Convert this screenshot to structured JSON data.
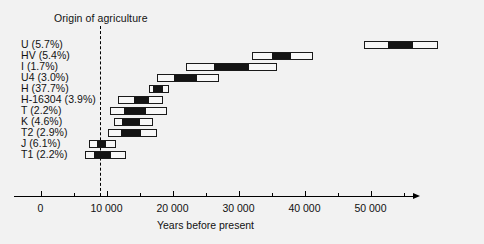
{
  "figure": {
    "background": "#f2f2f2",
    "bar_fill": "#f7f7f7",
    "bar_core": "#141414",
    "bar_edge": "#1a1a1a"
  },
  "annotation": {
    "origin_label": "Origin of agriculture",
    "origin_value": 9000
  },
  "chart_data": {
    "type": "bar",
    "orientation": "horizontal",
    "title": "",
    "xlabel": "Years before present",
    "ylabel": "",
    "xlim": [
      -3000,
      57000
    ],
    "xticks": [
      0,
      10000,
      20000,
      30000,
      40000,
      50000
    ],
    "xticklabels": [
      "0",
      "10 000",
      "20 000",
      "30 000",
      "40 000",
      "50 000"
    ],
    "minor_tick_interval": 5000,
    "grid": false,
    "legend": null,
    "note": "Each row is a mitochondrial haplogroup: outer light box = 95% confidence interval, inner black box = inter-quartile / core estimate range.",
    "categories": [
      "U (5.7%)",
      "HV (5.4%)",
      "I (1.7%)",
      "U4 (3.0%)",
      "H (37.7%)",
      "H-16304 (3.9%)",
      "T (2.2%)",
      "K (4.6%)",
      "T2 (2.9%)",
      "J (6.1%)",
      "T1 (2.2%)"
    ],
    "series": [
      {
        "name": "Coalescence age range (years before present)",
        "rows": [
          {
            "label": "U (5.7%)",
            "frequency_pct": 5.7,
            "outer_low": 49000,
            "outer_high": 60300,
            "core_low": 52700,
            "core_high": 56500
          },
          {
            "label": "HV (5.4%)",
            "frequency_pct": 5.4,
            "outer_low": 32100,
            "outer_high": 41300,
            "core_low": 35100,
            "core_high": 38000
          },
          {
            "label": "I (1.7%)",
            "frequency_pct": 1.7,
            "outer_low": 22000,
            "outer_high": 35900,
            "core_low": 26300,
            "core_high": 31600
          },
          {
            "label": "U4 (3.0%)",
            "frequency_pct": 3.0,
            "outer_low": 17600,
            "outer_high": 27000,
            "core_low": 20200,
            "core_high": 23700
          },
          {
            "label": "H (37.7%)",
            "frequency_pct": 37.7,
            "outer_low": 16400,
            "outer_high": 19400,
            "core_low": 17100,
            "core_high": 18500
          },
          {
            "label": "H-16304 (3.9%)",
            "frequency_pct": 3.9,
            "outer_low": 11800,
            "outer_high": 18600,
            "core_low": 14100,
            "core_high": 16500
          },
          {
            "label": "T (2.2%)",
            "frequency_pct": 2.2,
            "outer_low": 10600,
            "outer_high": 19100,
            "core_low": 12700,
            "core_high": 16000
          },
          {
            "label": "K (4.6%)",
            "frequency_pct": 4.6,
            "outer_low": 11100,
            "outer_high": 17000,
            "core_low": 12400,
            "core_high": 15100
          },
          {
            "label": "T2 (2.9%)",
            "frequency_pct": 2.9,
            "outer_low": 10300,
            "outer_high": 17700,
            "core_low": 12200,
            "core_high": 15200
          },
          {
            "label": "J (6.1%)",
            "frequency_pct": 6.1,
            "outer_low": 7300,
            "outer_high": 11400,
            "core_low": 8500,
            "core_high": 9900
          },
          {
            "label": "T1 (2.2%)",
            "frequency_pct": 2.2,
            "outer_low": 6800,
            "outer_high": 13000,
            "core_low": 8100,
            "core_high": 10700
          }
        ]
      }
    ]
  }
}
